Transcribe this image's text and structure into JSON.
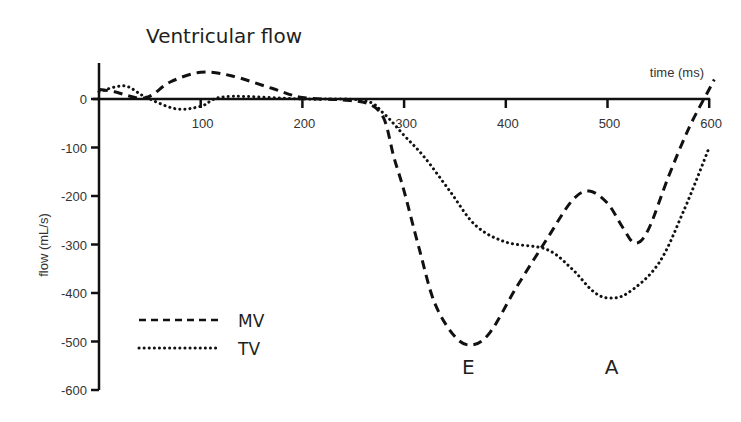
{
  "chart_data": {
    "type": "line",
    "title": "Ventricular flow",
    "xlabel": "time (ms)",
    "ylabel": "flow (mL/s)",
    "xlim": [
      0,
      600
    ],
    "ylim": [
      -600,
      60
    ],
    "x_ticks": [
      100,
      200,
      300,
      400,
      500,
      600
    ],
    "y_ticks": [
      0,
      -100,
      -200,
      -300,
      -400,
      -500,
      -600
    ],
    "grid": false,
    "legend_position": "lower-left",
    "series": [
      {
        "name": "MV",
        "style": "dashed",
        "points": [
          [
            0,
            20
          ],
          [
            15,
            15
          ],
          [
            45,
            2
          ],
          [
            70,
            35
          ],
          [
            100,
            55
          ],
          [
            130,
            48
          ],
          [
            170,
            22
          ],
          [
            200,
            3
          ],
          [
            240,
            -2
          ],
          [
            265,
            -10
          ],
          [
            280,
            -40
          ],
          [
            290,
            -120
          ],
          [
            300,
            -190
          ],
          [
            315,
            -310
          ],
          [
            330,
            -420
          ],
          [
            350,
            -490
          ],
          [
            367,
            -507
          ],
          [
            385,
            -480
          ],
          [
            410,
            -390
          ],
          [
            440,
            -290
          ],
          [
            465,
            -210
          ],
          [
            482,
            -190
          ],
          [
            500,
            -215
          ],
          [
            515,
            -265
          ],
          [
            527,
            -297
          ],
          [
            540,
            -270
          ],
          [
            560,
            -160
          ],
          [
            580,
            -60
          ],
          [
            600,
            20
          ],
          [
            605,
            40
          ]
        ]
      },
      {
        "name": "TV",
        "style": "dotted",
        "points": [
          [
            0,
            15
          ],
          [
            25,
            27
          ],
          [
            45,
            5
          ],
          [
            75,
            -20
          ],
          [
            100,
            -15
          ],
          [
            125,
            5
          ],
          [
            200,
            0
          ],
          [
            260,
            -3
          ],
          [
            280,
            -30
          ],
          [
            300,
            -75
          ],
          [
            320,
            -120
          ],
          [
            345,
            -190
          ],
          [
            370,
            -260
          ],
          [
            400,
            -295
          ],
          [
            440,
            -310
          ],
          [
            465,
            -350
          ],
          [
            485,
            -395
          ],
          [
            500,
            -410
          ],
          [
            520,
            -400
          ],
          [
            550,
            -340
          ],
          [
            575,
            -230
          ],
          [
            600,
            -100
          ]
        ]
      }
    ],
    "annotations": [
      {
        "text": "E",
        "x": 367,
        "y": -550
      },
      {
        "text": "A",
        "x": 508,
        "y": -550
      }
    ]
  }
}
